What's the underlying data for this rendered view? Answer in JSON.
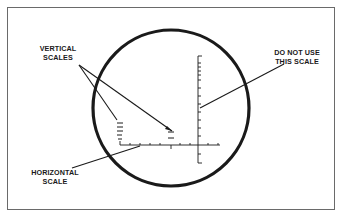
{
  "labels": {
    "vertical_scales": [
      "VERTICAL",
      "SCALES"
    ],
    "do_not_use": [
      "DO NOT USE",
      "THIS SCALE"
    ],
    "horizontal_scale": [
      "HORIZONTAL",
      "SCALE"
    ]
  },
  "colors": {
    "ink": "#1a1a1a",
    "frame": "#6a6a6a",
    "background": "#ffffff"
  }
}
